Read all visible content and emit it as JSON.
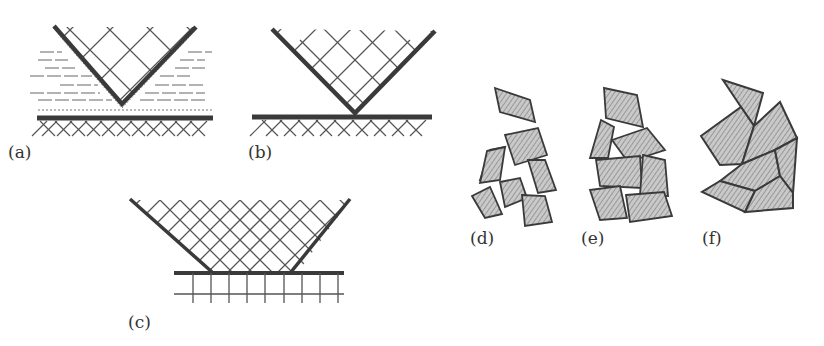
{
  "panels": {
    "a": {
      "label": "(a)"
    },
    "b": {
      "label": "(b)"
    },
    "c": {
      "label": "(c)"
    },
    "d": {
      "label": "(d)"
    },
    "e": {
      "label": "(e)"
    },
    "f": {
      "label": "(f)"
    }
  },
  "colors": {
    "line": "#3a3a3a",
    "fill": "#a8a8a8",
    "background": "#ffffff"
  }
}
